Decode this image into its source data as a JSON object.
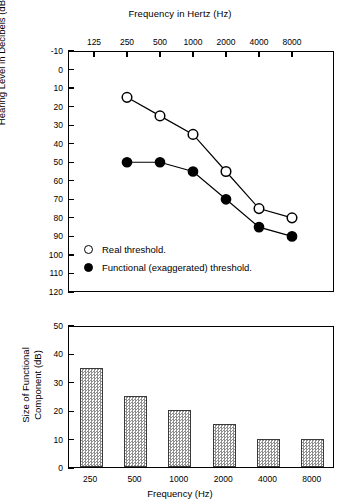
{
  "chart_data": [
    {
      "type": "line",
      "title": "Frequency in Hertz (Hz)",
      "xlabel": "Frequency in Hertz (Hz)",
      "ylabel": "Hearing Level in Decibels (dB)",
      "x_tick_labels": [
        "125",
        "250",
        "500",
        "1000",
        "2000",
        "4000",
        "8000"
      ],
      "categories": [
        125,
        250,
        500,
        1000,
        2000,
        4000,
        8000
      ],
      "y_tick_labels": [
        "-10",
        "0",
        "10",
        "20",
        "30",
        "40",
        "50",
        "60",
        "70",
        "80",
        "90",
        "100",
        "110",
        "120"
      ],
      "ylim": [
        -10,
        120
      ],
      "y_axis_inverted": true,
      "grid": false,
      "legend_position": "inside-lower-left",
      "series": [
        {
          "name": "Real threshold.",
          "marker": "open-circle",
          "x": [
            250,
            500,
            1000,
            2000,
            4000,
            8000
          ],
          "values": [
            15,
            25,
            35,
            55,
            75,
            80
          ]
        },
        {
          "name": "Functional (exaggerated) threshold.",
          "marker": "filled-circle",
          "x": [
            250,
            500,
            1000,
            2000,
            4000,
            8000
          ],
          "values": [
            50,
            50,
            55,
            70,
            85,
            90
          ]
        }
      ]
    },
    {
      "type": "bar",
      "title": "",
      "xlabel": "Frequency (Hz)",
      "ylabel": "Size of Functional Component (dB)",
      "ylabel_line1": "Size of Functional",
      "ylabel_line2": "Component (dB)",
      "categories": [
        "250",
        "500",
        "1000",
        "2000",
        "4000",
        "8000"
      ],
      "values": [
        35,
        25,
        20,
        15,
        10,
        10
      ],
      "y_tick_labels": [
        "0",
        "10",
        "20",
        "30",
        "40",
        "50"
      ],
      "ylim": [
        0,
        50
      ],
      "grid": false,
      "bar_fill": "#d4d4d4",
      "bar_edge": "#3a3a3a"
    }
  ],
  "top": {
    "title": "Frequency in Hertz (Hz)",
    "y_axis_title": "Hearing Level in Decibels (dB)",
    "legend": [
      {
        "label": "Real threshold.",
        "marker": "open-circle"
      },
      {
        "label": "Functional (exaggerated) threshold.",
        "marker": "filled-circle"
      }
    ]
  },
  "bottom": {
    "y_axis_title_line1": "Size of Functional",
    "y_axis_title_line2": "Component (dB)",
    "x_axis_title": "Frequency (Hz)"
  },
  "colors": {
    "axis": "#000000",
    "marker_open": "#ffffff",
    "marker_filled": "#000000",
    "bar_fill": "#d4d4d4",
    "bar_edge": "#3a3a3a"
  }
}
